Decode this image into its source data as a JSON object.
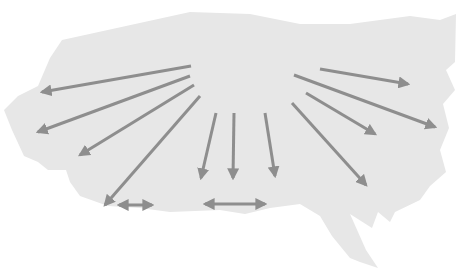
{
  "diagram": {
    "title": "",
    "background": "#ffffff",
    "region": {
      "name": "map-region",
      "fill": "#e7e7e7",
      "outline": "190,12 250,14 300,24 350,24 410,16 440,20 456,14 455,62 446,70 455,90 443,104 449,128 440,150 446,172 430,186 420,200 395,212 390,222 378,212 372,228 350,214 366,250 378,268 360,262 350,258 332,236 320,216 300,204 270,208 245,214 220,210 170,212 140,208 108,206 80,196 70,182 66,170 48,170 38,162 24,156 12,130 4,110 18,96 38,86 50,58 62,40"
    },
    "arrow_style": {
      "color": "#8e8e8e",
      "width": 3
    },
    "arrows": [
      {
        "id": "arrow-west-upper",
        "x1": 191,
        "y1": 66,
        "x2": 42,
        "y2": 92,
        "double": false
      },
      {
        "id": "arrow-west-lower",
        "x1": 190,
        "y1": 76,
        "x2": 38,
        "y2": 132,
        "double": false
      },
      {
        "id": "arrow-southwest-1",
        "x1": 194,
        "y1": 85,
        "x2": 80,
        "y2": 155,
        "double": false
      },
      {
        "id": "arrow-southwest-2",
        "x1": 200,
        "y1": 96,
        "x2": 105,
        "y2": 205,
        "double": false
      },
      {
        "id": "arrow-south-1",
        "x1": 216,
        "y1": 113,
        "x2": 201,
        "y2": 178,
        "double": false
      },
      {
        "id": "arrow-south-2",
        "x1": 234,
        "y1": 113,
        "x2": 233,
        "y2": 178,
        "double": false
      },
      {
        "id": "arrow-south-3",
        "x1": 265,
        "y1": 113,
        "x2": 275,
        "y2": 176,
        "double": false
      },
      {
        "id": "arrow-southeast-1",
        "x1": 292,
        "y1": 103,
        "x2": 366,
        "y2": 185,
        "double": false
      },
      {
        "id": "arrow-southeast-2",
        "x1": 306,
        "y1": 93,
        "x2": 375,
        "y2": 134,
        "double": false
      },
      {
        "id": "arrow-east-lower",
        "x1": 294,
        "y1": 75,
        "x2": 435,
        "y2": 127,
        "double": false
      },
      {
        "id": "arrow-east-upper",
        "x1": 320,
        "y1": 69,
        "x2": 408,
        "y2": 84,
        "double": false
      },
      {
        "id": "arrow-double-left",
        "x1": 119,
        "y1": 205,
        "x2": 152,
        "y2": 205,
        "double": true
      },
      {
        "id": "arrow-double-right",
        "x1": 205,
        "y1": 204,
        "x2": 265,
        "y2": 204,
        "double": true
      }
    ]
  }
}
